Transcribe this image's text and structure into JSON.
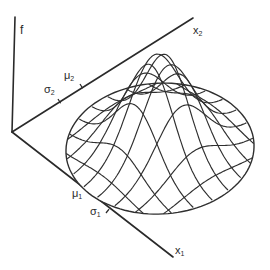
{
  "figure": {
    "type": "bivariate-normal-density-surface",
    "axes": {
      "vertical": {
        "label": "f"
      },
      "x2": {
        "label": "x",
        "subscript": "2"
      },
      "x1": {
        "label": "x",
        "subscript": "1"
      }
    },
    "annotations": {
      "sigma2": {
        "symbol": "σ",
        "subscript": "2"
      },
      "mu2": {
        "symbol": "μ",
        "subscript": "2"
      },
      "mu1": {
        "symbol": "μ",
        "subscript": "1"
      },
      "sigma1": {
        "symbol": "σ",
        "subscript": "1"
      }
    },
    "geometry": {
      "origin": [
        12,
        132
      ],
      "f_axis_top": [
        15,
        17
      ],
      "x2_axis_end": [
        193,
        18
      ],
      "x1_axis_end": [
        173,
        257
      ],
      "ticks": {
        "sigma2": [
          58,
          99
        ],
        "mu2": [
          80,
          84
        ],
        "mu1": [
          92,
          196
        ],
        "sigma1": [
          106,
          213
        ]
      },
      "surface_center": [
        160,
        150
      ],
      "peak_height": 94,
      "radius_x": 94,
      "radius_y": 64,
      "mesh_lines": 9
    },
    "colors": {
      "ink": "#2a2a2a",
      "background": "#ffffff"
    }
  }
}
